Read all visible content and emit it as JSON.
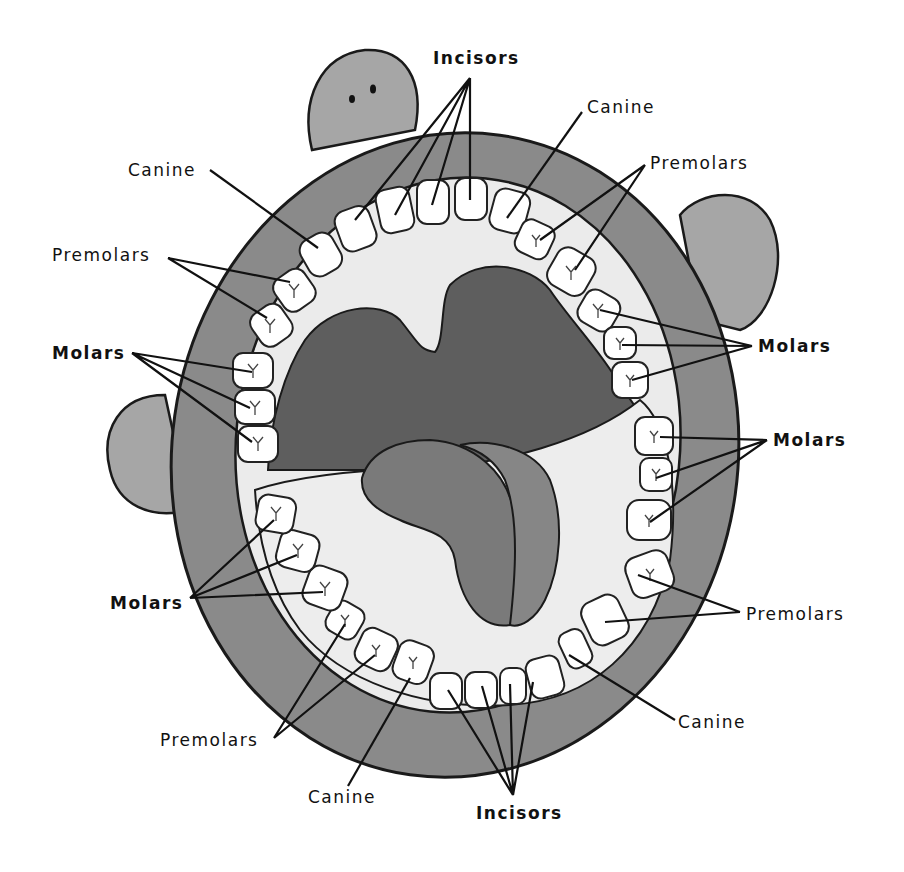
{
  "diagram": {
    "colors": {
      "background": "#ffffff",
      "lips": "#8a8a8a",
      "bumps": "#a8a8a8",
      "gums": "#e8e8e8",
      "throat": "#5e5e5e",
      "tongue": "#7d7d7d",
      "tooth": "#ffffff",
      "outline": "#1a1a1a"
    },
    "labels": {
      "upper_incisors": "Incisors",
      "upper_left_canine": "Canine",
      "upper_right_canine": "Canine",
      "upper_left_premolars": "Premolars",
      "upper_right_premolars": "Premolars",
      "upper_left_molars": "Molars",
      "upper_right_molars": "Molars",
      "lower_right_molars": "Molars",
      "lower_left_molars": "Molars",
      "lower_right_premolars": "Premolars",
      "lower_left_premolars": "Premolars",
      "lower_right_canine": "Canine",
      "lower_left_canine": "Canine",
      "lower_incisors": "Incisors"
    },
    "tooth_counts": {
      "incisors_upper": 4,
      "incisors_lower": 4,
      "canines": 4,
      "premolars": 8,
      "molars": 12
    }
  }
}
